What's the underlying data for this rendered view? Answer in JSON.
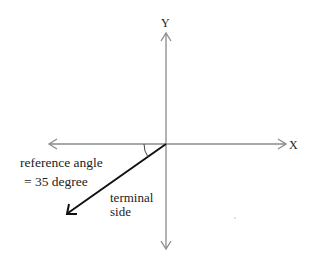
{
  "diagram": {
    "type": "reference-angle-diagram",
    "axes": {
      "x_label": "X",
      "y_label": "Y",
      "color": "#8a8a8a"
    },
    "terminal_side": {
      "label_line1": "terminal",
      "label_line2": "side",
      "color": "#111111",
      "angle_below_negative_x_deg": 35
    },
    "reference_angle": {
      "label_line1": "reference angle",
      "label_line2": "= 35 degree",
      "value_deg": 35
    }
  }
}
